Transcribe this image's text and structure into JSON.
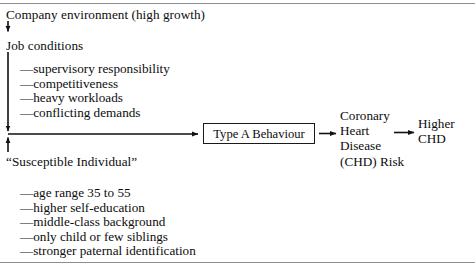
{
  "figure": {
    "type": "flow-diagram",
    "background": "#ffffff",
    "ink": "#0d0d0d",
    "rule_color": "#8e8e8e"
  },
  "nodes": {
    "company_environment": "Company environment (high growth)",
    "job_conditions": "Job conditions",
    "susceptible_individual": "“Susceptible Individual”",
    "type_a_behaviour": "Type A Behaviour",
    "chd_risk_lines": [
      "Coronary",
      "Heart",
      "Disease",
      "(CHD) Risk"
    ],
    "higher_chd_lines": [
      "Higher",
      "CHD"
    ]
  },
  "job_factors": [
    "—supervisory responsibility",
    "—competitiveness",
    "—heavy workloads",
    "—conflicting demands"
  ],
  "person_traits": [
    "—age range 35 to 55",
    "—higher self-education",
    "—middle-class background",
    "—only child or few siblings",
    "—stronger paternal identification"
  ],
  "connectors": [
    {
      "name": "company-to-jobconditions",
      "kind": "arrow-down"
    },
    {
      "name": "jobconditions-to-spine",
      "kind": "arrow-down"
    },
    {
      "name": "susceptible-to-spine",
      "kind": "arrow-up"
    },
    {
      "name": "spine-to-typea",
      "kind": "arrow-right"
    },
    {
      "name": "typea-to-chd",
      "kind": "arrow-right"
    },
    {
      "name": "chd-to-highercdh",
      "kind": "arrow-right"
    }
  ]
}
